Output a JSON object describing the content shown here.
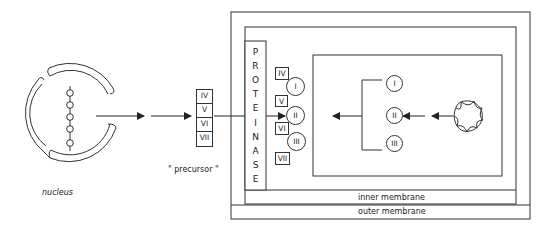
{
  "diagram": {
    "nucleus": {
      "label": "nucleus"
    },
    "precursor": {
      "label": "\" precursor \"",
      "subunits": [
        "IV",
        "V",
        "VI",
        "VII"
      ]
    },
    "mitochondrion": {
      "proteinase_letters": [
        "P",
        "R",
        "O",
        "T",
        "E",
        "I",
        "N",
        "A",
        "S",
        "E"
      ],
      "intermembrane_subunits": [
        "IV",
        "V",
        "VI",
        "VII"
      ],
      "intermembrane_circles": [
        "I",
        "II",
        "III"
      ],
      "matrix_circles": [
        "I",
        "II",
        "III"
      ],
      "inner_membrane_label": "inner membrane",
      "outer_membrane_label": "outer membrane"
    },
    "colors": {
      "line": "#333333",
      "background": "#ffffff"
    }
  }
}
